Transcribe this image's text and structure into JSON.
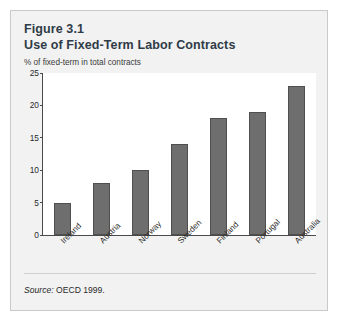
{
  "figure": {
    "title": "Figure 3.1",
    "subtitle": "Use of Fixed-Term Labor Contracts",
    "source_label": "Source:",
    "source_text": "OECD 1999."
  },
  "chart_data": {
    "type": "bar",
    "title": "Use of Fixed-Term Labor Contracts",
    "subtitle": "Figure 3.1",
    "xlabel": "",
    "ylabel": "% of fixed-term in total contracts",
    "categories": [
      "Ireland",
      "Austria",
      "Norway",
      "Sweden",
      "Finland",
      "Portugal",
      "Australia"
    ],
    "values": [
      5,
      8,
      10,
      14,
      18,
      19,
      23
    ],
    "ylim": [
      0,
      25
    ],
    "yticks": [
      0,
      5,
      10,
      15,
      20,
      25
    ],
    "grid": false,
    "legend": false,
    "bar_color": "#6e6e6e",
    "bar_border_color": "#4f4f4f",
    "axis_color": "#4a4a4a",
    "plot_background": "#ffffff",
    "card_background": "#f2f2f2",
    "title_color": "#2f3b47",
    "source": "Source: OECD 1999."
  }
}
